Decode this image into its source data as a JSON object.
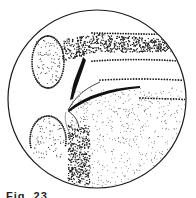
{
  "figure": {
    "caption": "Fig. 23.",
    "ink_color": "#1a1a1a",
    "background": "#ffffff",
    "circle": {
      "cx": 97,
      "cy": 99,
      "r": 89
    }
  }
}
